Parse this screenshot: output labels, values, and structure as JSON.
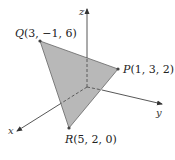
{
  "diagram": {
    "type": "3d-coordinate-triangle",
    "axes": {
      "x_label": "x",
      "y_label": "y",
      "z_label": "z"
    },
    "points": [
      {
        "name": "Q",
        "coords": "(3, −1, 6)"
      },
      {
        "name": "P",
        "coords": "(1, 3, 2)"
      },
      {
        "name": "R",
        "coords": "(5, 2, 0)"
      }
    ],
    "colors": {
      "triangle_fill": "#b8b8b8",
      "triangle_stroke": "#555555",
      "axis": "#444444",
      "vertex": "#444444"
    }
  }
}
